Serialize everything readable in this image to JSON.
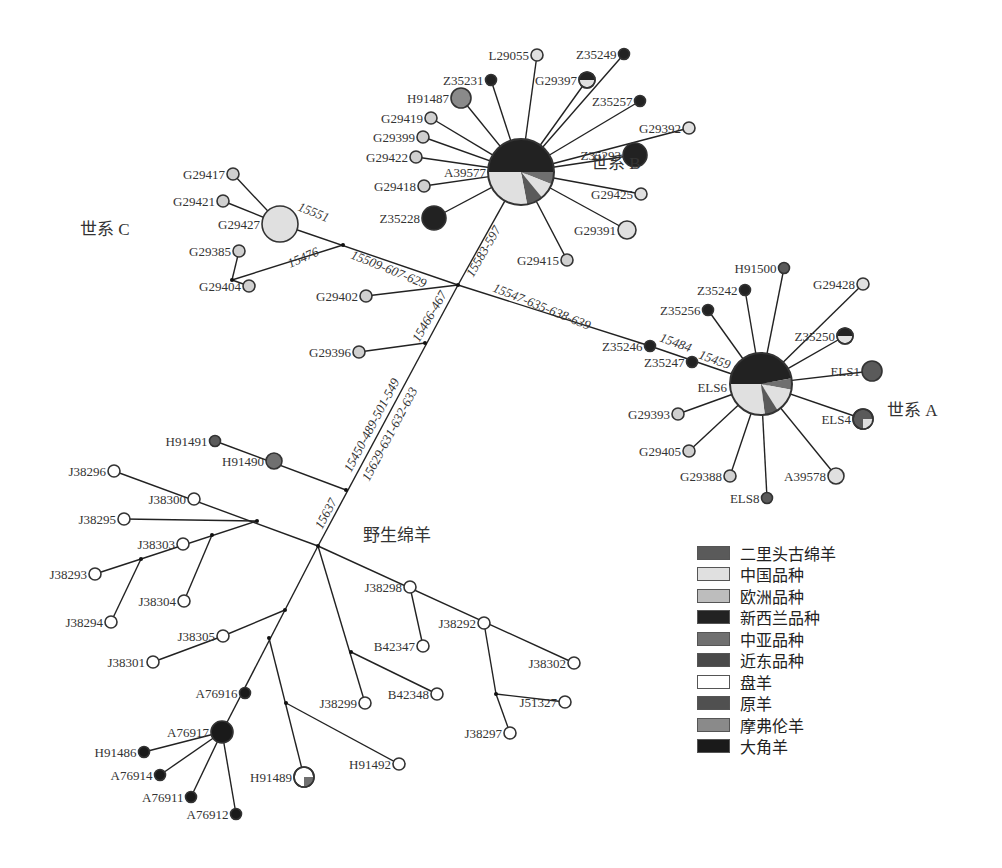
{
  "groups": [
    {
      "id": "lineageB",
      "label": "世系 B",
      "x": 591,
      "y": 169
    },
    {
      "id": "lineageC",
      "label": "世系 C",
      "x": 80,
      "y": 235
    },
    {
      "id": "lineageA",
      "label": "世系 A",
      "x": 887,
      "y": 416
    },
    {
      "id": "wild",
      "label": "野生绵羊",
      "x": 363,
      "y": 541
    }
  ],
  "legend": [
    {
      "label": "二里头古绵羊",
      "color": "#5a5a5a"
    },
    {
      "label": "中国品种",
      "color": "#e0e0e0"
    },
    {
      "label": "欧洲品种",
      "color": "#bdbdbd"
    },
    {
      "label": "新西兰品种",
      "color": "#222222"
    },
    {
      "label": "中亚品种",
      "color": "#707070"
    },
    {
      "label": "近东品种",
      "color": "#4a4a4a"
    },
    {
      "label": "盘羊",
      "color": "#ffffff"
    },
    {
      "label": "原羊",
      "color": "#505050"
    },
    {
      "label": "摩弗伦羊",
      "color": "#8a8a8a"
    },
    {
      "label": "大角羊",
      "color": "#1a1a1a"
    }
  ],
  "hubs": [
    {
      "id": "A39577",
      "label": "A39577",
      "x": 521,
      "y": 172,
      "r": 33,
      "lx": 486,
      "ly": 177,
      "slices": [
        {
          "from": 0,
          "to": 0.5,
          "color": "#222222"
        },
        {
          "from": 0.5,
          "to": 0.56,
          "color": "#707070"
        },
        {
          "from": 0.56,
          "to": 0.64,
          "color": "#e0e0e0"
        },
        {
          "from": 0.64,
          "to": 0.72,
          "color": "#5a5a5a"
        },
        {
          "from": 0.72,
          "to": 1.0,
          "color": "#e0e0e0"
        }
      ]
    },
    {
      "id": "ELS6",
      "label": "ELS6",
      "x": 761,
      "y": 384,
      "r": 31,
      "lx": 727,
      "ly": 392,
      "slices": [
        {
          "from": 0,
          "to": 0.47,
          "color": "#222222"
        },
        {
          "from": 0.47,
          "to": 0.53,
          "color": "#707070"
        },
        {
          "from": 0.53,
          "to": 0.66,
          "color": "#e0e0e0"
        },
        {
          "from": 0.66,
          "to": 0.73,
          "color": "#5a5a5a"
        },
        {
          "from": 0.73,
          "to": 1.0,
          "color": "#e0e0e0"
        }
      ]
    }
  ],
  "nodes": [
    {
      "label": "L29055",
      "x": 537,
      "y": 55,
      "r": 6,
      "fill": "#e0e0e0",
      "anchor": "end"
    },
    {
      "label": "Z35249",
      "x": 624,
      "y": 54,
      "r": 5.5,
      "fill": "#222222",
      "anchor": "end"
    },
    {
      "label": "Z35231",
      "x": 491,
      "y": 80,
      "r": 5.5,
      "fill": "#222222",
      "anchor": "end"
    },
    {
      "label": "G29397",
      "x": 587,
      "y": 80,
      "r": 8,
      "fill": "#e0e0e0",
      "half": "#222222",
      "anchor": "end"
    },
    {
      "label": "H91487",
      "x": 461,
      "y": 98,
      "r": 10,
      "fill": "#8a8a8a",
      "anchor": "end"
    },
    {
      "label": "Z35257",
      "x": 640,
      "y": 101,
      "r": 5.5,
      "fill": "#222222",
      "anchor": "end"
    },
    {
      "label": "G29419",
      "x": 431,
      "y": 118,
      "r": 6,
      "fill": "#d0d0d0",
      "anchor": "end"
    },
    {
      "label": "G29399",
      "x": 423,
      "y": 137,
      "r": 6,
      "fill": "#d0d0d0",
      "anchor": "end"
    },
    {
      "label": "G29392",
      "x": 689,
      "y": 128,
      "r": 6,
      "fill": "#e0e0e0",
      "anchor": "end"
    },
    {
      "label": "G29422",
      "x": 416,
      "y": 157,
      "r": 6,
      "fill": "#d0d0d0",
      "anchor": "end"
    },
    {
      "label": "Z35293",
      "x": 635,
      "y": 155,
      "r": 12,
      "fill": "#222222",
      "anchor": "end"
    },
    {
      "label": "G29418",
      "x": 424,
      "y": 186,
      "r": 6,
      "fill": "#d0d0d0",
      "anchor": "end"
    },
    {
      "label": "G29425",
      "x": 641,
      "y": 194,
      "r": 6,
      "fill": "#e0e0e0",
      "anchor": "end"
    },
    {
      "label": "Z35228",
      "x": 434,
      "y": 218,
      "r": 12,
      "fill": "#222222",
      "anchor": "end"
    },
    {
      "label": "G29391",
      "x": 627,
      "y": 230,
      "r": 9,
      "fill": "#e0e0e0",
      "anchor": "end"
    },
    {
      "label": "G29415",
      "x": 567,
      "y": 260,
      "r": 6,
      "fill": "#d0d0d0",
      "anchor": "end"
    },
    {
      "label": "G29417",
      "x": 233,
      "y": 174,
      "r": 6,
      "fill": "#d0d0d0",
      "anchor": "end"
    },
    {
      "label": "G29421",
      "x": 223,
      "y": 201,
      "r": 6,
      "fill": "#d0d0d0",
      "anchor": "end"
    },
    {
      "label": "G29427",
      "x": 280,
      "y": 224,
      "r": 18,
      "fill": "#e0e0e0",
      "anchor": "end"
    },
    {
      "label": "G29385",
      "x": 239,
      "y": 251,
      "r": 6,
      "fill": "#d0d0d0",
      "anchor": "end"
    },
    {
      "label": "G29404",
      "x": 249,
      "y": 286,
      "r": 6,
      "fill": "#d0d0d0",
      "anchor": "end"
    },
    {
      "label": "G29402",
      "x": 366,
      "y": 296,
      "r": 6,
      "fill": "#d0d0d0",
      "anchor": "end"
    },
    {
      "label": "G29396",
      "x": 359,
      "y": 352,
      "r": 6,
      "fill": "#d0d0d0",
      "anchor": "end"
    },
    {
      "label": "H91500",
      "x": 784,
      "y": 268,
      "r": 5.5,
      "fill": "#5a5a5a",
      "anchor": "end"
    },
    {
      "label": "G29428",
      "x": 863,
      "y": 284,
      "r": 6,
      "fill": "#e0e0e0",
      "anchor": "end"
    },
    {
      "label": "Z35242",
      "x": 745,
      "y": 290,
      "r": 5.5,
      "fill": "#222222",
      "anchor": "end"
    },
    {
      "label": "Z35256",
      "x": 708,
      "y": 310,
      "r": 5.5,
      "fill": "#222222",
      "anchor": "end"
    },
    {
      "label": "Z35250",
      "x": 845,
      "y": 336,
      "r": 8,
      "fill": "#e0e0e0",
      "half": "#222222",
      "anchor": "end"
    },
    {
      "label": "Z35246",
      "x": 650,
      "y": 346,
      "r": 5.5,
      "fill": "#222222",
      "anchor": "end"
    },
    {
      "label": "Z35247",
      "x": 692,
      "y": 362,
      "r": 5.5,
      "fill": "#222222",
      "anchor": "end"
    },
    {
      "label": "ELS1",
      "x": 872,
      "y": 371,
      "r": 10,
      "fill": "#5a5a5a",
      "anchor": "end"
    },
    {
      "label": "G29393",
      "x": 678,
      "y": 414,
      "r": 6,
      "fill": "#d0d0d0",
      "anchor": "end"
    },
    {
      "label": "ELS4",
      "x": 863,
      "y": 419,
      "r": 10,
      "fill": "#5a5a5a",
      "quarter": "#e0e0e0",
      "anchor": "end"
    },
    {
      "label": "G29405",
      "x": 689,
      "y": 451,
      "r": 6,
      "fill": "#d0d0d0",
      "anchor": "end"
    },
    {
      "label": "G29388",
      "x": 730,
      "y": 476,
      "r": 6,
      "fill": "#d0d0d0",
      "anchor": "end"
    },
    {
      "label": "A39578",
      "x": 836,
      "y": 476,
      "r": 8,
      "fill": "#e0e0e0",
      "anchor": "end"
    },
    {
      "label": "ELS8",
      "x": 767,
      "y": 498,
      "r": 5.5,
      "fill": "#5a5a5a",
      "anchor": "end"
    },
    {
      "label": "H91491",
      "x": 215,
      "y": 441,
      "r": 5.5,
      "fill": "#5a5a5a",
      "anchor": "end"
    },
    {
      "label": "H91490",
      "x": 274,
      "y": 461,
      "r": 8,
      "fill": "#707070",
      "anchor": "end"
    },
    {
      "label": "J38296",
      "x": 114,
      "y": 471,
      "r": 6,
      "fill": "#ffffff",
      "anchor": "end"
    },
    {
      "label": "J38300",
      "x": 194,
      "y": 499,
      "r": 6,
      "fill": "#ffffff",
      "anchor": "end"
    },
    {
      "label": "J38295",
      "x": 124,
      "y": 519,
      "r": 6,
      "fill": "#ffffff",
      "anchor": "end"
    },
    {
      "label": "J38303",
      "x": 183,
      "y": 544,
      "r": 6,
      "fill": "#ffffff",
      "anchor": "end"
    },
    {
      "label": "J38293",
      "x": 95,
      "y": 574,
      "r": 6,
      "fill": "#ffffff",
      "anchor": "end"
    },
    {
      "label": "J38304",
      "x": 184,
      "y": 601,
      "r": 6,
      "fill": "#ffffff",
      "anchor": "end"
    },
    {
      "label": "J38294",
      "x": 111,
      "y": 622,
      "r": 6,
      "fill": "#ffffff",
      "anchor": "end"
    },
    {
      "label": "J38298",
      "x": 410,
      "y": 587,
      "r": 6,
      "fill": "#ffffff",
      "anchor": "end"
    },
    {
      "label": "J38292",
      "x": 484,
      "y": 623,
      "r": 6,
      "fill": "#ffffff",
      "anchor": "end"
    },
    {
      "label": "B42347",
      "x": 423,
      "y": 646,
      "r": 6,
      "fill": "#ffffff",
      "anchor": "end"
    },
    {
      "label": "J38305",
      "x": 223,
      "y": 636,
      "r": 6,
      "fill": "#ffffff",
      "anchor": "end"
    },
    {
      "label": "J38302",
      "x": 574,
      "y": 663,
      "r": 6,
      "fill": "#ffffff",
      "anchor": "end"
    },
    {
      "label": "J38301",
      "x": 153,
      "y": 662,
      "r": 6,
      "fill": "#ffffff",
      "anchor": "end"
    },
    {
      "label": "B42348",
      "x": 437,
      "y": 694,
      "r": 6,
      "fill": "#ffffff",
      "anchor": "end"
    },
    {
      "label": "J51327",
      "x": 565,
      "y": 702,
      "r": 6,
      "fill": "#ffffff",
      "anchor": "end"
    },
    {
      "label": "A76916",
      "x": 245,
      "y": 693,
      "r": 5.5,
      "fill": "#1a1a1a",
      "anchor": "end"
    },
    {
      "label": "J38299",
      "x": 365,
      "y": 703,
      "r": 6,
      "fill": "#ffffff",
      "anchor": "end"
    },
    {
      "label": "J38297",
      "x": 510,
      "y": 733,
      "r": 6,
      "fill": "#ffffff",
      "anchor": "end"
    },
    {
      "label": "A76917",
      "x": 222,
      "y": 732,
      "r": 11,
      "fill": "#1a1a1a",
      "anchor": "end"
    },
    {
      "label": "H91486",
      "x": 144,
      "y": 752,
      "r": 5.5,
      "fill": "#1a1a1a",
      "anchor": "end"
    },
    {
      "label": "H91492",
      "x": 399,
      "y": 764,
      "r": 6,
      "fill": "#ffffff",
      "anchor": "end"
    },
    {
      "label": "H91489",
      "x": 304,
      "y": 777,
      "r": 10,
      "fill": "#ffffff",
      "quarter": "#707070",
      "anchor": "end"
    },
    {
      "label": "A76914",
      "x": 160,
      "y": 775,
      "r": 5.5,
      "fill": "#1a1a1a",
      "anchor": "end"
    },
    {
      "label": "A76911",
      "x": 191,
      "y": 797,
      "r": 5.5,
      "fill": "#1a1a1a",
      "anchor": "end"
    },
    {
      "label": "A76912",
      "x": 236,
      "y": 814,
      "r": 5.5,
      "fill": "#1a1a1a",
      "anchor": "end"
    }
  ],
  "junctions": [
    {
      "x": 343,
      "y": 245
    },
    {
      "x": 232,
      "y": 280
    },
    {
      "x": 458,
      "y": 285
    },
    {
      "x": 425,
      "y": 343
    },
    {
      "x": 346,
      "y": 490
    },
    {
      "x": 318,
      "y": 546
    },
    {
      "x": 257,
      "y": 521
    },
    {
      "x": 212,
      "y": 535
    },
    {
      "x": 141,
      "y": 559
    },
    {
      "x": 285,
      "y": 610
    },
    {
      "x": 269,
      "y": 638
    },
    {
      "x": 286,
      "y": 703
    },
    {
      "x": 351,
      "y": 652
    },
    {
      "x": 496,
      "y": 694
    }
  ],
  "edges": [
    [
      521,
      172,
      537,
      55
    ],
    [
      521,
      172,
      624,
      54
    ],
    [
      521,
      172,
      491,
      80
    ],
    [
      521,
      172,
      587,
      80
    ],
    [
      521,
      172,
      461,
      98
    ],
    [
      521,
      172,
      640,
      101
    ],
    [
      521,
      172,
      431,
      118
    ],
    [
      521,
      172,
      423,
      137
    ],
    [
      521,
      172,
      689,
      128
    ],
    [
      521,
      172,
      416,
      157
    ],
    [
      521,
      172,
      635,
      155
    ],
    [
      521,
      172,
      424,
      186
    ],
    [
      521,
      172,
      641,
      194
    ],
    [
      521,
      172,
      434,
      218
    ],
    [
      521,
      172,
      627,
      230
    ],
    [
      521,
      172,
      567,
      260
    ],
    [
      280,
      224,
      233,
      174
    ],
    [
      280,
      224,
      223,
      201
    ],
    [
      280,
      224,
      458,
      285
    ],
    [
      343,
      245,
      232,
      280
    ],
    [
      232,
      280,
      239,
      251
    ],
    [
      232,
      280,
      249,
      286
    ],
    [
      458,
      285,
      366,
      296
    ],
    [
      458,
      285,
      521,
      172
    ],
    [
      458,
      285,
      650,
      346
    ],
    [
      650,
      346,
      761,
      384
    ],
    [
      458,
      285,
      318,
      546
    ],
    [
      425,
      343,
      359,
      352
    ],
    [
      761,
      384,
      784,
      268
    ],
    [
      761,
      384,
      863,
      284
    ],
    [
      761,
      384,
      745,
      290
    ],
    [
      761,
      384,
      708,
      310
    ],
    [
      761,
      384,
      845,
      336
    ],
    [
      761,
      384,
      872,
      371
    ],
    [
      761,
      384,
      678,
      414
    ],
    [
      761,
      384,
      863,
      419
    ],
    [
      761,
      384,
      689,
      451
    ],
    [
      761,
      384,
      730,
      476
    ],
    [
      761,
      384,
      836,
      476
    ],
    [
      761,
      384,
      767,
      498
    ],
    [
      346,
      490,
      215,
      441
    ],
    [
      114,
      471,
      318,
      546
    ],
    [
      257,
      521,
      124,
      519
    ],
    [
      257,
      521,
      141,
      559
    ],
    [
      141,
      559,
      95,
      574
    ],
    [
      141,
      559,
      111,
      622
    ],
    [
      212,
      535,
      184,
      601
    ],
    [
      318,
      546,
      574,
      663
    ],
    [
      410,
      587,
      423,
      646
    ],
    [
      484,
      623,
      496,
      694
    ],
    [
      496,
      694,
      510,
      733
    ],
    [
      496,
      694,
      565,
      702
    ],
    [
      318,
      546,
      222,
      732
    ],
    [
      285,
      610,
      223,
      636
    ],
    [
      223,
      636,
      153,
      662
    ],
    [
      318,
      546,
      365,
      703
    ],
    [
      351,
      652,
      437,
      694
    ],
    [
      269,
      638,
      304,
      777
    ],
    [
      286,
      703,
      399,
      764
    ],
    [
      222,
      732,
      144,
      752
    ],
    [
      222,
      732,
      160,
      775
    ],
    [
      222,
      732,
      191,
      797
    ],
    [
      222,
      732,
      236,
      814
    ]
  ],
  "edge_labels": [
    {
      "text": "15551",
      "x": 297,
      "y": 210,
      "rot": 22
    },
    {
      "text": "15476",
      "x": 290,
      "y": 268,
      "rot": -24
    },
    {
      "text": "15509-607-629",
      "x": 350,
      "y": 258,
      "rot": 22
    },
    {
      "text": "15583-597",
      "x": 473,
      "y": 278,
      "rot": -60
    },
    {
      "text": "15547-635-638-639",
      "x": 492,
      "y": 291,
      "rot": 22
    },
    {
      "text": "15466-467",
      "x": 419,
      "y": 343,
      "rot": -60
    },
    {
      "text": "15484",
      "x": 659,
      "y": 341,
      "rot": 20
    },
    {
      "text": "15459",
      "x": 698,
      "y": 358,
      "rot": 20
    },
    {
      "text": "15450-489-501-549",
      "x": 351,
      "y": 473,
      "rot": -62
    },
    {
      "text": "15629-631-632-633",
      "x": 369,
      "y": 482,
      "rot": -62
    },
    {
      "text": "15637",
      "x": 322,
      "y": 530,
      "rot": -62
    }
  ]
}
